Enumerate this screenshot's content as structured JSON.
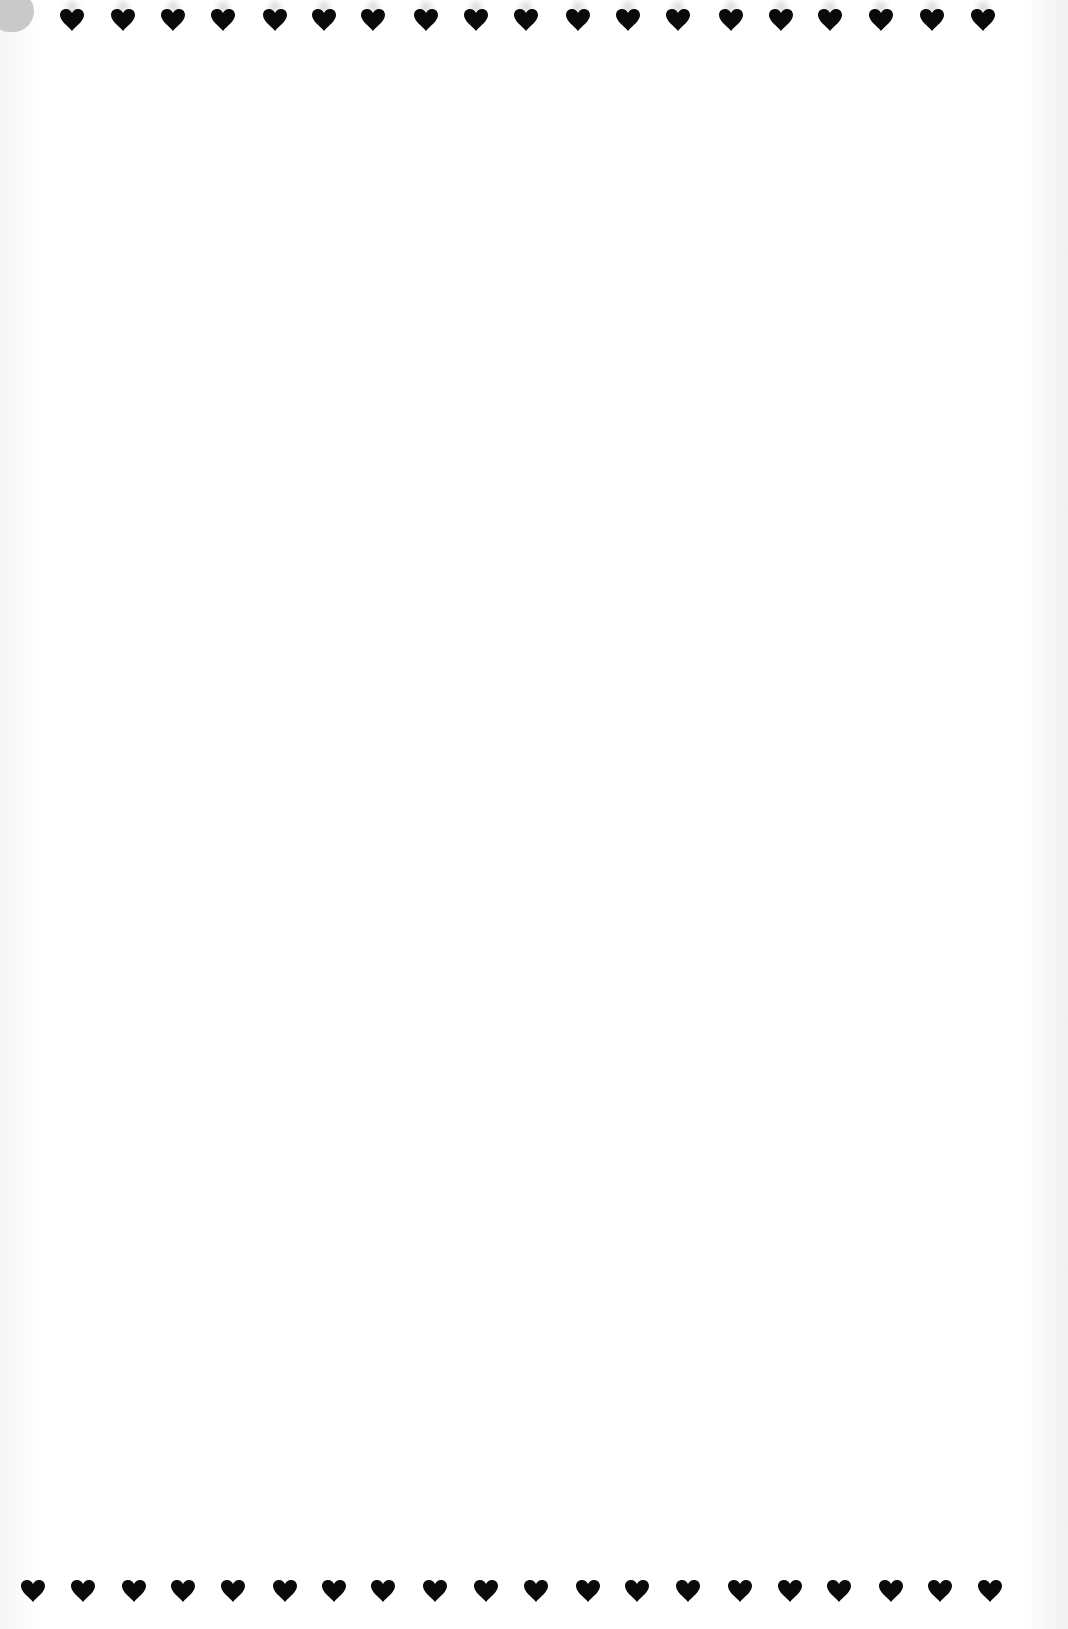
{
  "page": {
    "background_color": "#ffffff",
    "heart_color": "#0a0a0a",
    "smudge_color": "#c9c9c9"
  },
  "top_row": {
    "icon": "heart-icon",
    "count": 19,
    "y": 8,
    "x_positions": [
      59,
      110,
      160,
      210,
      262,
      311,
      360,
      413,
      463,
      513,
      565,
      615,
      665,
      718,
      768,
      817,
      868,
      919,
      970
    ]
  },
  "bottom_row": {
    "icon": "heart-icon",
    "count": 20,
    "y": 1579,
    "x_positions": [
      20,
      70,
      121,
      170,
      220,
      272,
      321,
      370,
      422,
      473,
      523,
      575,
      624,
      675,
      727,
      777,
      826,
      878,
      927,
      977
    ]
  }
}
